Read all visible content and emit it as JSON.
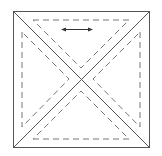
{
  "diagram": {
    "title": "",
    "type": "quarter-square-triangle",
    "stroke_color": "#555555",
    "dash_color": "#777777",
    "background": "#ffffff",
    "outer_square": {
      "x": 13,
      "y": 11,
      "size": 136
    },
    "center": {
      "x": 81,
      "y": 79
    },
    "grain_arrow": {
      "x1": 61,
      "y1": 29,
      "x2": 93,
      "y2": 29,
      "direction": "horizontal-bidirectional"
    },
    "seam_triangles": [
      {
        "name": "top",
        "points": "33,20 129,20 81,68"
      },
      {
        "name": "left",
        "points": "22,32 22,127 69,79"
      },
      {
        "name": "right",
        "points": "140,32 140,127 93,79"
      },
      {
        "name": "bottom",
        "points": "33,139 129,139 81,91"
      }
    ]
  }
}
